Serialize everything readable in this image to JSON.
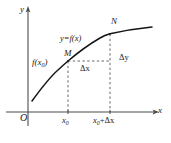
{
  "figure": {
    "background_color": "#ffffff",
    "ink_color": "#1a1a1a",
    "axis_color": "#4d4d4d",
    "dash_color": "#555555"
  },
  "axes": {
    "y_label": "y",
    "x_label": "x",
    "origin_label": "O",
    "y_axis_x": 28,
    "x_axis_y": 112,
    "y_axis_top": 8,
    "y_axis_bottom": 126,
    "x_axis_left": 6,
    "x_axis_right": 157
  },
  "curve": {
    "label": "y=f(x)",
    "shape": "increasing concave-down",
    "start": [
      32,
      101
    ],
    "end": [
      152,
      27
    ],
    "points": [
      [
        32,
        101
      ],
      [
        40,
        90
      ],
      [
        50,
        78
      ],
      [
        58,
        70
      ],
      [
        68,
        61
      ],
      [
        80,
        51
      ],
      [
        92,
        43
      ],
      [
        104,
        36
      ],
      [
        110,
        33
      ],
      [
        124,
        31
      ],
      [
        138,
        29
      ],
      [
        152,
        27
      ]
    ]
  },
  "points": {
    "M": {
      "label": "M",
      "x": 68,
      "y": 61,
      "value_label": "f(x₀)",
      "value_label_base": "f(x",
      "value_label_sub": "0",
      "value_label_close": ")"
    },
    "N": {
      "label": "N",
      "x": 110,
      "y": 34
    }
  },
  "increments": {
    "delta_x_label": "Δx",
    "delta_y_label": "Δy"
  },
  "ticks": {
    "x0": {
      "label_base": "x",
      "label_sub": "0",
      "label": "x₀",
      "x": 68
    },
    "x0_plus_dx": {
      "label_base": "x",
      "label_sub": "0",
      "label_rest": "+Δx",
      "label": "x₀+Δx",
      "x": 110
    }
  },
  "guides": {
    "vertical_at_x0": {
      "x": 68,
      "y_top": 61,
      "y_bottom": 112
    },
    "vertical_at_x0dx": {
      "x": 110,
      "y_top": 34,
      "y_bottom": 112
    },
    "horizontal_mn": {
      "y": 61,
      "x_left": 68,
      "x_right": 110
    }
  }
}
